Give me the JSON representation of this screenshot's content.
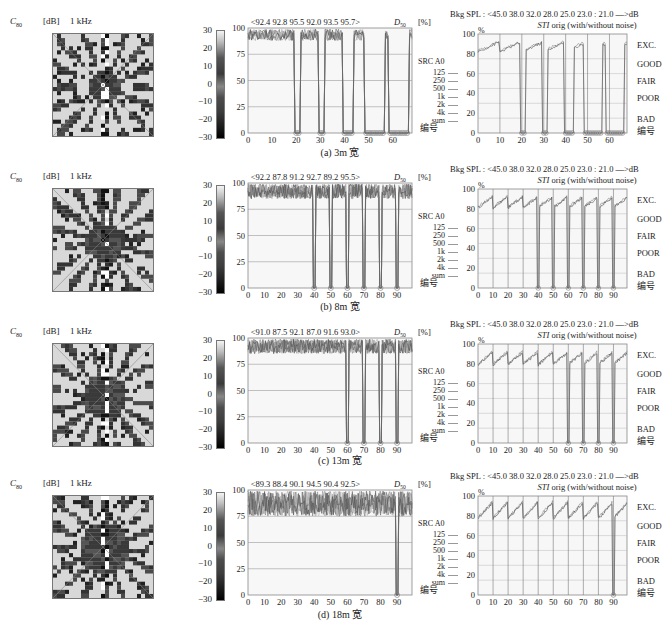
{
  "figure": {
    "heatmap_label": {
      "symbol": "C",
      "subscript": "80",
      "unit": "[dB]",
      "freq": "1  kHz"
    },
    "colorbar_ticks": [
      "30",
      "20",
      "10",
      "0",
      "−10",
      "−20",
      "−30"
    ],
    "d50": {
      "y_ticks": [
        "100",
        "75",
        "50",
        "25",
        "0"
      ],
      "ylabel_symbol": "D",
      "ylabel_sub": "50",
      "ylabel_unit": "[%]",
      "legend_title": "SRC  A0",
      "legend_items": [
        "125",
        "250",
        "500",
        "1k",
        "2k",
        "4k",
        "sum"
      ],
      "xlabel": "编号"
    },
    "sti": {
      "header_line1": "Bkg  SPL : <45.0  38.0  32.0  28.0  25.0  23.0 : 21.0  —>dB",
      "header_pct": "%",
      "header_line2_sym": "STI",
      "header_line2": " orig  (with/without noise)",
      "y_ticks": [
        "100",
        "80",
        "60",
        "40",
        "20",
        "0"
      ],
      "ratings": [
        "EXC.",
        "GOOD",
        "FAIR",
        "POOR",
        "BAD"
      ],
      "xlabel": "编号"
    }
  },
  "rows": [
    {
      "caption": "(a)  3m 宽",
      "d50_values": "<92.4  92.8  95.5  92.0  93.5  95.7>",
      "x_ticks": [
        "0",
        "10",
        "20",
        "30",
        "40",
        "50",
        "60"
      ],
      "x_max": 68
    },
    {
      "caption": "(b)  8m 宽",
      "d50_values": "<92.2  87.8  91.2  92.7  89.2  95.5>",
      "x_ticks": [
        "0",
        "10",
        "20",
        "30",
        "40",
        "50",
        "60",
        "70",
        "80",
        "90"
      ],
      "x_max": 99
    },
    {
      "caption": "(c)  13m 宽",
      "d50_values": "<91.0  87.5  92.1  87.0 91.6  93.0>",
      "x_ticks": [
        "0",
        "10",
        "20",
        "30",
        "40",
        "50",
        "60",
        "70",
        "80",
        "90"
      ],
      "x_max": 99
    },
    {
      "caption": "(d)  18m 宽",
      "d50_values": "<89.3  88.4  90.1  94.5  90.4  92.5>",
      "x_ticks": [
        "0",
        "10",
        "20",
        "30",
        "40",
        "50",
        "60",
        "70",
        "80",
        "90"
      ],
      "x_max": 99
    }
  ],
  "chart_data": [
    {
      "type": "line",
      "title": "D50 vs receiver number (3m wide)",
      "xlabel": "编号",
      "ylabel": "D50 [%]",
      "ylim": [
        0,
        100
      ],
      "xlim": [
        0,
        68
      ],
      "series_names": [
        "125",
        "250",
        "500",
        "1k",
        "2k",
        "4k",
        "sum"
      ],
      "annotation": "<92.4 92.8 95.5 92.0 93.5 95.7>",
      "segments": [
        [
          0,
          19
        ],
        [
          22,
          29
        ],
        [
          32,
          39
        ],
        [
          44,
          48
        ],
        [
          57,
          58
        ],
        [
          67,
          68
        ]
      ],
      "typical_value_range": [
        88,
        99
      ],
      "gap_value": 0
    },
    {
      "type": "line",
      "title": "STI vs receiver number (3m wide)",
      "xlabel": "编号",
      "ylabel": "%",
      "ylim": [
        0,
        100
      ],
      "xlim": [
        0,
        68
      ],
      "header": "Bkg SPL : <45.0 38.0 32.0 28.0 25.0 23.0 : 21.0 —>dB; STI orig (with/without noise)",
      "ratings": [
        "EXC.",
        "GOOD",
        "FAIR",
        "POOR",
        "BAD"
      ],
      "segments": [
        [
          0,
          19
        ],
        [
          22,
          29
        ],
        [
          32,
          39
        ],
        [
          44,
          48
        ],
        [
          57,
          58
        ],
        [
          67,
          68
        ]
      ],
      "typical_value_range": [
        83,
        93
      ],
      "gap_value": 0
    },
    {
      "type": "line",
      "title": "D50 vs receiver number (8m wide)",
      "xlabel": "编号",
      "ylabel": "D50 [%]",
      "ylim": [
        0,
        100
      ],
      "xlim": [
        0,
        99
      ],
      "annotation": "<92.2 87.8 91.2 92.7 89.2 95.5>",
      "dips_at": [
        40,
        50,
        60,
        70,
        80,
        90
      ],
      "typical_value_range": [
        85,
        99
      ]
    },
    {
      "type": "line",
      "title": "STI vs receiver number (8m wide)",
      "xlabel": "编号",
      "ylabel": "%",
      "ylim": [
        0,
        100
      ],
      "xlim": [
        0,
        99
      ],
      "dips_at": [
        40,
        50,
        60,
        70,
        80,
        90
      ],
      "typical_value_range": [
        82,
        93
      ]
    },
    {
      "type": "line",
      "title": "D50 vs receiver number (13m wide)",
      "xlabel": "编号",
      "ylabel": "D50 [%]",
      "ylim": [
        0,
        100
      ],
      "xlim": [
        0,
        99
      ],
      "annotation": "<91.0 87.5 92.1 87.0 91.6 93.0>",
      "dips_at": [
        60,
        70,
        80,
        90
      ],
      "typical_value_range": [
        85,
        99
      ]
    },
    {
      "type": "line",
      "title": "STI vs receiver number (13m wide)",
      "xlabel": "编号",
      "ylabel": "%",
      "ylim": [
        0,
        100
      ],
      "xlim": [
        0,
        99
      ],
      "dips_at": [
        60,
        70,
        80,
        90
      ],
      "typical_value_range": [
        80,
        93
      ]
    },
    {
      "type": "line",
      "title": "D50 vs receiver number (18m wide)",
      "xlabel": "编号",
      "ylabel": "D50 [%]",
      "ylim": [
        0,
        100
      ],
      "xlim": [
        0,
        99
      ],
      "annotation": "<89.3 88.4 90.1 94.5 90.4 92.5>",
      "dips_at": [
        90
      ],
      "typical_value_range": [
        75,
        99
      ]
    },
    {
      "type": "line",
      "title": "STI vs receiver number (18m wide)",
      "xlabel": "编号",
      "ylabel": "%",
      "ylim": [
        0,
        100
      ],
      "xlim": [
        0,
        99
      ],
      "dips_at": [
        90
      ],
      "typical_value_range": [
        78,
        95
      ]
    }
  ]
}
